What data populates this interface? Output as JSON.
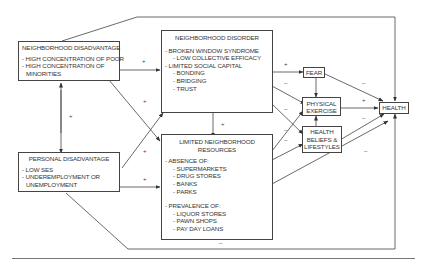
{
  "diagram": {
    "nodes": {
      "neighborhood_disadvantage": {
        "title": "NEIGHBORHOOD DISADVANTAGE",
        "lines": [
          "- HIGH CONCENTRATION OF POOR",
          "- HIGH CONCENTRATION OF",
          "  MINORITIES"
        ]
      },
      "personal_disadvantage": {
        "title": "PERSONAL DISADVANTAGE",
        "lines": [
          "- LOW SES",
          "- UNDEREMPLOYMENT OR",
          "  UNEMPLOYMENT"
        ]
      },
      "neighborhood_disorder": {
        "title": "NEIGHBORHOOD DISORDER",
        "lines": [
          "- BROKEN WINDOW SYNDROME",
          "- LOW COLLECTIVE EFFICACY",
          "- LIMITED SOCIAL CAPITAL",
          "- BONDING",
          "- BRIDGING",
          "- TRUST"
        ]
      },
      "limited_resources": {
        "title1": "LIMITED NEIGHBORHOOD",
        "title2": "RESOURCES",
        "absence_header": "- ABSENCE OF:",
        "absence": [
          "- SUPERMARKETS",
          "- DRUG STORES",
          "- BANKS",
          "- PARKS"
        ],
        "prevalence_header": "- PREVALENCE OF:",
        "prevalence": [
          "- LIQUOR STORES",
          "- PAWN SHOPS",
          "- PAY DAY LOANS"
        ]
      },
      "fear": {
        "title": "FEAR"
      },
      "physical_exercise": {
        "line1": "PHYSICAL",
        "line2": "EXERCISE"
      },
      "health_beliefs": {
        "line1": "HEALTH",
        "line2": "BELIEFS &",
        "line3": "LIFESTYLES"
      },
      "health": {
        "title": "HEALTH"
      }
    },
    "signs": {
      "nd_to_disorder": "+",
      "nd_to_resources": "+",
      "nd_pd_link": "+",
      "pd_to_disorder": "+",
      "pd_to_resources": "+",
      "disorder_to_resources": "+",
      "disorder_to_fear": "+",
      "disorder_to_exercise": "–",
      "disorder_to_beliefs": "–",
      "resources_to_exercise": "–",
      "resources_to_beliefs": "–",
      "fear_to_health": "–",
      "exercise_to_health": "+",
      "beliefs_to_health": "–",
      "resources_to_health": "–",
      "pd_to_health": "–"
    }
  }
}
